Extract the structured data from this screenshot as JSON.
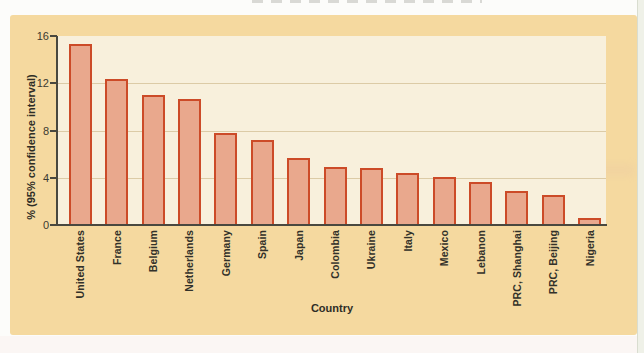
{
  "chart_data": {
    "type": "bar",
    "title": "",
    "xlabel": "Country",
    "ylabel": "% (95% confidence interval)",
    "ylim": [
      0,
      16
    ],
    "yticks": [
      0,
      4,
      8,
      12,
      16
    ],
    "grid": true,
    "legend": false,
    "categories": [
      "United States",
      "France",
      "Belgium",
      "Netherlands",
      "Germany",
      "Spain",
      "Japan",
      "Colombia",
      "Ukraine",
      "Italy",
      "Mexico",
      "Lebanon",
      "PRC, Shanghai",
      "PRC, Beijing",
      "Nigeria"
    ],
    "values": [
      15.3,
      12.4,
      11.0,
      10.7,
      7.8,
      7.2,
      5.7,
      4.9,
      4.8,
      4.4,
      4.1,
      3.6,
      2.9,
      2.5,
      0.6
    ]
  },
  "colors": {
    "panel_bg": "#f5d99f",
    "plot_bg": "#f8f0dc",
    "gridline": "#dccba6",
    "bar_fill": "#e9a88d",
    "bar_border": "#cc4b28",
    "axis": "#49483f",
    "text": "#32312a"
  }
}
